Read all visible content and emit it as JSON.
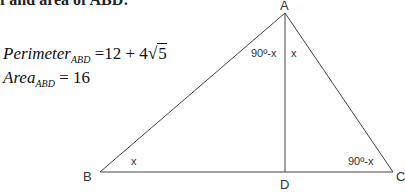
{
  "header": {
    "text": "f and area of ABD:"
  },
  "formulas": {
    "perimeter": {
      "label": "Perimeter",
      "subscript": "ABD",
      "equals": "=",
      "value_prefix": "12 + 4",
      "radicand": "5"
    },
    "area": {
      "label": "Area",
      "subscript": "ABD",
      "equals": "=",
      "value": "16"
    }
  },
  "diagram": {
    "vertices": {
      "A": "A",
      "B": "B",
      "C": "C",
      "D": "D"
    },
    "angles": {
      "at_A_left": "90º-x",
      "at_A_right": "x",
      "at_B": "x",
      "at_C": "90º-x"
    },
    "line_color": "#444444"
  }
}
